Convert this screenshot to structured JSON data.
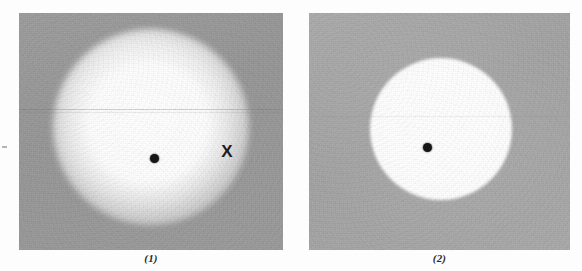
{
  "figure": {
    "type": "photographic-plate-pair",
    "panels": [
      {
        "id": "plate-1",
        "caption": "(1)",
        "background_tone": "#9a9a9a",
        "feature": "diffuse soft-edged halo",
        "halo_diameter_px": 196,
        "markers": [
          {
            "name": "center-dot",
            "symbol": "●",
            "x": 135,
            "y": 145
          },
          {
            "name": "x-marker",
            "symbol": "X",
            "x": 208,
            "y": 139
          }
        ]
      },
      {
        "id": "plate-2",
        "caption": "(2)",
        "background_tone": "#a8a8a8",
        "feature": "sharp-edged bright disk",
        "disk_diameter_px": 142,
        "markers": [
          {
            "name": "center-dot",
            "symbol": "●",
            "x": 418,
            "y": 147
          }
        ]
      }
    ]
  },
  "captions": {
    "panel_1": "(1)",
    "panel_2": "(2)"
  },
  "markers": {
    "x_label": "X"
  },
  "colors": {
    "page_background": "#fdfdfd",
    "plate_1_background": "#9a9a9a",
    "plate_2_background": "#a8a8a8",
    "highlight": "#ffffff",
    "marker_ink": "#161616",
    "caption_ink": "#2a2a2a"
  }
}
